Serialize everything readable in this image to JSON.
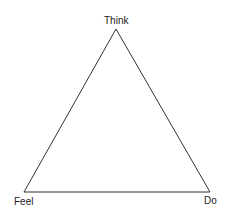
{
  "diagram": {
    "type": "triangle",
    "vertices": {
      "top": {
        "label": "Think"
      },
      "bottom_left": {
        "label": "Feel"
      },
      "bottom_right": {
        "label": "Do"
      }
    },
    "stroke_color": "#333333",
    "background": "#ffffff"
  }
}
